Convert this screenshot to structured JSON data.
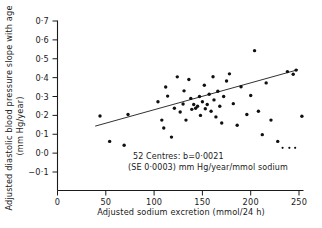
{
  "chart_data": {
    "type": "scatter",
    "title": "",
    "subtitle": "",
    "xlabel": "Adjusted sodium excretion (mmol/24 h)",
    "ylabel": "Adjusted diastolic blood pressure slope with age (mm Hg/year)",
    "ylabel_line1": "Adjusted diastolic blood pressure slope with age",
    "ylabel_line2": "(mm Hg/year)",
    "xlim": [
      0,
      260
    ],
    "ylim": [
      -0.15,
      0.72
    ],
    "xticks": [
      0,
      50,
      100,
      150,
      200,
      250
    ],
    "xtick_labels": [
      "0",
      "50",
      "100",
      "150",
      "200",
      "250"
    ],
    "yticks": [
      -0.1,
      0.0,
      0.1,
      0.2,
      0.3,
      0.4,
      0.5,
      0.6,
      0.7
    ],
    "ytick_labels": [
      "−0·1",
      "0·0",
      "0·1",
      "0·2",
      "0·3",
      "0·4",
      "0·5",
      "0·6",
      "0·7"
    ],
    "grid": false,
    "legend": "none",
    "n_points": 52,
    "marker_color": "#101010",
    "line_color": "#1a1a1a",
    "annotations": [
      "52 Centres:  b=0·0021",
      "(SE 0·0003) mm Hg/year/mmol sodium"
    ],
    "regression": {
      "slope": 0.0021,
      "se": 0.0003,
      "units": "mm Hg/year/mmol sodium",
      "n_centres": 52,
      "x_start": 39,
      "x_end": 249,
      "y_start": 0.143,
      "y_end": 0.442
    },
    "points": [
      {
        "x": 44,
        "y": 0.197
      },
      {
        "x": 54,
        "y": 0.062
      },
      {
        "x": 69,
        "y": 0.042
      },
      {
        "x": 73,
        "y": 0.205
      },
      {
        "x": 104,
        "y": 0.272
      },
      {
        "x": 108,
        "y": 0.175
      },
      {
        "x": 110,
        "y": 0.133
      },
      {
        "x": 112,
        "y": 0.35
      },
      {
        "x": 114,
        "y": 0.302
      },
      {
        "x": 118,
        "y": 0.085
      },
      {
        "x": 121,
        "y": 0.238
      },
      {
        "x": 124,
        "y": 0.404
      },
      {
        "x": 127,
        "y": 0.218
      },
      {
        "x": 130,
        "y": 0.26
      },
      {
        "x": 131,
        "y": 0.33
      },
      {
        "x": 133,
        "y": 0.175
      },
      {
        "x": 136,
        "y": 0.39
      },
      {
        "x": 138,
        "y": 0.29
      },
      {
        "x": 139,
        "y": 0.232
      },
      {
        "x": 141,
        "y": 0.258
      },
      {
        "x": 143,
        "y": 0.238
      },
      {
        "x": 145,
        "y": 0.248
      },
      {
        "x": 147,
        "y": 0.3
      },
      {
        "x": 148,
        "y": 0.2
      },
      {
        "x": 150,
        "y": 0.272
      },
      {
        "x": 152,
        "y": 0.36
      },
      {
        "x": 153,
        "y": 0.235
      },
      {
        "x": 155,
        "y": 0.258
      },
      {
        "x": 157,
        "y": 0.312
      },
      {
        "x": 159,
        "y": 0.222
      },
      {
        "x": 161,
        "y": 0.405
      },
      {
        "x": 162,
        "y": 0.282
      },
      {
        "x": 164,
        "y": 0.192
      },
      {
        "x": 166,
        "y": 0.328
      },
      {
        "x": 168,
        "y": 0.248
      },
      {
        "x": 170,
        "y": 0.16
      },
      {
        "x": 172,
        "y": 0.3
      },
      {
        "x": 175,
        "y": 0.382
      },
      {
        "x": 178,
        "y": 0.42
      },
      {
        "x": 182,
        "y": 0.262
      },
      {
        "x": 186,
        "y": 0.148
      },
      {
        "x": 190,
        "y": 0.352
      },
      {
        "x": 196,
        "y": 0.205
      },
      {
        "x": 200,
        "y": 0.305
      },
      {
        "x": 204,
        "y": 0.543
      },
      {
        "x": 208,
        "y": 0.222
      },
      {
        "x": 212,
        "y": 0.098
      },
      {
        "x": 216,
        "y": 0.372
      },
      {
        "x": 221,
        "y": 0.175
      },
      {
        "x": 228,
        "y": 0.062
      },
      {
        "x": 238,
        "y": 0.432
      },
      {
        "x": 244,
        "y": 0.418
      },
      {
        "x": 247,
        "y": 0.44
      },
      {
        "x": 253,
        "y": 0.195
      }
    ],
    "small_points": [
      {
        "x": 233,
        "y": 0.028
      },
      {
        "x": 240,
        "y": 0.028
      },
      {
        "x": 246,
        "y": 0.028
      }
    ]
  }
}
